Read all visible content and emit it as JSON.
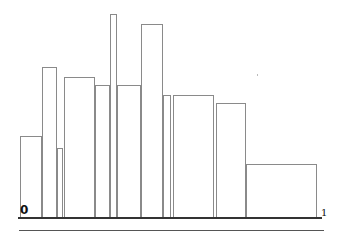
{
  "chart_data": {
    "type": "bar",
    "title": "",
    "xlabel": "",
    "ylabel": "",
    "x_axis": {
      "start_label": "0",
      "end_label": "1"
    },
    "grid": false,
    "legend": null,
    "bars": [
      {
        "x0": 0.0,
        "x1": 0.074,
        "value": 0.4
      },
      {
        "x0": 0.074,
        "x1": 0.125,
        "value": 0.74
      },
      {
        "x0": 0.125,
        "x1": 0.145,
        "value": 0.34
      },
      {
        "x0": 0.148,
        "x1": 0.253,
        "value": 0.69
      },
      {
        "x0": 0.253,
        "x1": 0.304,
        "value": 0.65
      },
      {
        "x0": 0.304,
        "x1": 0.328,
        "value": 1.0
      },
      {
        "x0": 0.328,
        "x1": 0.409,
        "value": 0.65
      },
      {
        "x0": 0.409,
        "x1": 0.483,
        "value": 0.95
      },
      {
        "x0": 0.483,
        "x1": 0.51,
        "value": 0.6
      },
      {
        "x0": 0.514,
        "x1": 0.652,
        "value": 0.6
      },
      {
        "x0": 0.659,
        "x1": 0.76,
        "value": 0.56
      },
      {
        "x0": 0.76,
        "x1": 1.0,
        "value": 0.26
      }
    ]
  },
  "labels": {
    "start": "0",
    "end": "1"
  }
}
